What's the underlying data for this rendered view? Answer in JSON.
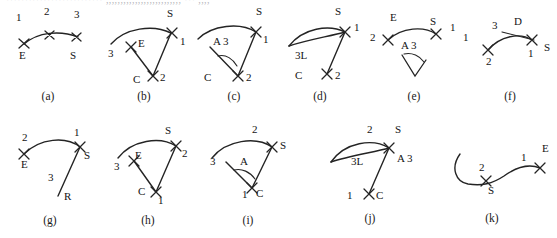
{
  "sheet": {
    "cut_off_header_text": "·························· ,,,,,,,,,,,,,,,,,,,,,,,,,, ··· ,,,,",
    "background_color": "#ffffff",
    "ink_color": "#1a1a1a",
    "rows": 2,
    "panel_count": 11
  },
  "panels": [
    {
      "id": "a",
      "caption": "(a)",
      "description": "shallow arc with three X cross marks",
      "labels": [
        {
          "text": "1",
          "x": 18,
          "y": 14
        },
        {
          "text": "2",
          "x": 42,
          "y": 11
        },
        {
          "text": "3",
          "x": 70,
          "y": 13
        },
        {
          "text": "E",
          "x": 17,
          "y": 45
        },
        {
          "text": "S",
          "x": 64,
          "y": 45
        }
      ]
    },
    {
      "id": "b",
      "caption": "(b)",
      "description": "arc with two straight legs meeting at vertex C forming a sector",
      "labels": [
        {
          "text": "S",
          "x": 63,
          "y": 10
        },
        {
          "text": "1",
          "x": 72,
          "y": 33
        },
        {
          "text": "E",
          "x": 32,
          "y": 31
        },
        {
          "text": "3",
          "x": 6,
          "y": 40
        },
        {
          "text": "C",
          "x": 27,
          "y": 70
        },
        {
          "text": "2",
          "x": 54,
          "y": 66
        }
      ]
    },
    {
      "id": "c",
      "caption": "(c)",
      "description": "arc sector with interior angle arc, annotated A 3",
      "labels": [
        {
          "text": "S",
          "x": 62,
          "y": 8
        },
        {
          "text": "1",
          "x": 68,
          "y": 30
        },
        {
          "text": "A 3",
          "x": 22,
          "y": 30
        },
        {
          "text": "C",
          "x": 12,
          "y": 65
        },
        {
          "text": "2",
          "x": 52,
          "y": 65
        }
      ]
    },
    {
      "id": "d",
      "caption": "(d)",
      "description": "lens shaped double arc with a straight leg to C, annotated 3L",
      "labels": [
        {
          "text": "S",
          "x": 50,
          "y": 8
        },
        {
          "text": "1",
          "x": 70,
          "y": 18
        },
        {
          "text": "3L",
          "x": 12,
          "y": 38
        },
        {
          "text": "C",
          "x": 12,
          "y": 66
        },
        {
          "text": "2",
          "x": 48,
          "y": 66
        }
      ]
    },
    {
      "id": "e",
      "caption": "(e)",
      "description": "arc from E to S with a detached wedge marker below, annotated A 3",
      "labels": [
        {
          "text": "E",
          "x": 24,
          "y": 12
        },
        {
          "text": "S",
          "x": 64,
          "y": 14
        },
        {
          "text": "1",
          "x": 84,
          "y": 18
        },
        {
          "text": "2",
          "x": 4,
          "y": 25
        },
        {
          "text": "A 3",
          "x": 35,
          "y": 38
        }
      ]
    },
    {
      "id": "f",
      "caption": "(f)",
      "description": "arc with a short straight chord crossing near the right end, annotated D",
      "labels": [
        {
          "text": "1",
          "x": 2,
          "y": 22
        },
        {
          "text": "3",
          "x": 33,
          "y": 11
        },
        {
          "text": "D",
          "x": 55,
          "y": 9
        },
        {
          "text": "S",
          "x": 88,
          "y": 31
        },
        {
          "text": "1",
          "x": 70,
          "y": 38
        },
        {
          "text": "2",
          "x": 30,
          "y": 45
        }
      ]
    },
    {
      "id": "g",
      "caption": "(g)",
      "description": "arc from E to S with a long straight tail down to R",
      "labels": [
        {
          "text": "2",
          "x": 18,
          "y": 5
        },
        {
          "text": "1",
          "x": 66,
          "y": 2
        },
        {
          "text": "E",
          "x": 18,
          "y": 36
        },
        {
          "text": "S",
          "x": 74,
          "y": 27
        },
        {
          "text": "3",
          "x": 42,
          "y": 52
        },
        {
          "text": "R",
          "x": 56,
          "y": 70
        }
      ]
    },
    {
      "id": "h",
      "caption": "(h)",
      "description": "arc sector with two legs meeting at vertex C",
      "labels": [
        {
          "text": "S",
          "x": 58,
          "y": 5
        },
        {
          "text": "2",
          "x": 74,
          "y": 28
        },
        {
          "text": "E",
          "x": 30,
          "y": 32
        },
        {
          "text": "3",
          "x": 6,
          "y": 43
        },
        {
          "text": "C",
          "x": 32,
          "y": 68
        },
        {
          "text": "1",
          "x": 52,
          "y": 72
        }
      ]
    },
    {
      "id": "i",
      "caption": "(i)",
      "description": "arc sector with an interior angle arc labelled A and vertex C",
      "labels": [
        {
          "text": "2",
          "x": 48,
          "y": 2
        },
        {
          "text": "S",
          "x": 76,
          "y": 22
        },
        {
          "text": "3",
          "x": 4,
          "y": 38
        },
        {
          "text": "A",
          "x": 38,
          "y": 38
        },
        {
          "text": "1",
          "x": 36,
          "y": 70
        },
        {
          "text": "C",
          "x": 50,
          "y": 70
        }
      ]
    },
    {
      "id": "j",
      "caption": "(j)",
      "description": "lens shaped double arc with a straight leg down to C, annotated 3L and A 3",
      "labels": [
        {
          "text": "2",
          "x": 44,
          "y": 2
        },
        {
          "text": "S",
          "x": 72,
          "y": 2
        },
        {
          "text": "3L",
          "x": 28,
          "y": 33
        },
        {
          "text": "A 3",
          "x": 74,
          "y": 30
        },
        {
          "text": "1",
          "x": 18,
          "y": 66
        },
        {
          "text": "C",
          "x": 48,
          "y": 66
        }
      ]
    },
    {
      "id": "k",
      "caption": "(k)",
      "description": "S shaped curve with a hook at the left end",
      "labels": [
        {
          "text": "2",
          "x": 36,
          "y": 22
        },
        {
          "text": "S",
          "x": 46,
          "y": 52
        },
        {
          "text": "1",
          "x": 80,
          "y": 18
        },
        {
          "text": "E",
          "x": 100,
          "y": 10
        }
      ]
    }
  ],
  "captions": {
    "a": "(a)",
    "b": "(b)",
    "c": "(c)",
    "d": "(d)",
    "e": "(e)",
    "f": "(f)",
    "g": "(g)",
    "h": "(h)",
    "i": "(i)",
    "j": "(j)",
    "k": "(k)"
  }
}
